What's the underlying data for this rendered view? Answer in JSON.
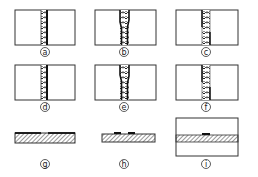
{
  "figure": {
    "panels": [
      {
        "id": "a",
        "label": "a",
        "type": "vertical-strip",
        "x": 15,
        "y": 10,
        "w": 60,
        "h": 35,
        "strip_x": 41,
        "strip_w": 7,
        "variant": "right-edge"
      },
      {
        "id": "b",
        "label": "b",
        "type": "vertical-strip",
        "x": 95,
        "y": 10,
        "w": 61,
        "h": 35,
        "strip_x": 120,
        "strip_w": 9,
        "variant": "both-edges"
      },
      {
        "id": "c",
        "label": "c",
        "type": "vertical-strip",
        "x": 176,
        "y": 10,
        "w": 62,
        "h": 35,
        "strip_x": 201,
        "strip_w": 9,
        "variant": "offset-edges"
      },
      {
        "id": "d",
        "label": "d",
        "type": "vertical-strip",
        "x": 15,
        "y": 65,
        "w": 60,
        "h": 35,
        "strip_x": 41,
        "strip_w": 7,
        "variant": "right-edge"
      },
      {
        "id": "e",
        "label": "e",
        "type": "vertical-strip",
        "x": 95,
        "y": 65,
        "w": 61,
        "h": 35,
        "strip_x": 120,
        "strip_w": 9,
        "variant": "both-edges"
      },
      {
        "id": "f",
        "label": "f",
        "type": "vertical-strip",
        "x": 176,
        "y": 65,
        "w": 62,
        "h": 35,
        "strip_x": 201,
        "strip_w": 9,
        "variant": "offset-edges"
      },
      {
        "id": "g",
        "label": "g",
        "type": "horizontal-bar",
        "x": 15,
        "y": 133,
        "w": 60,
        "h": 10
      },
      {
        "id": "h",
        "label": "h",
        "type": "horizontal-bar",
        "x": 102,
        "y": 134,
        "w": 53,
        "h": 8
      },
      {
        "id": "i",
        "label": "i",
        "type": "boxed-band",
        "x": 176,
        "y": 118,
        "w": 62,
        "h": 38,
        "band_y": 135,
        "band_h": 7
      }
    ],
    "labels": {
      "a": "a",
      "b": "b",
      "c": "c",
      "d": "d",
      "e": "e",
      "f": "f",
      "g": "g",
      "h": "h",
      "i": "i"
    }
  }
}
